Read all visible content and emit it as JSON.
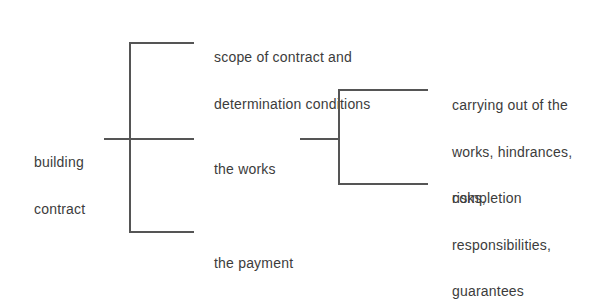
{
  "diagram": {
    "type": "tree",
    "line_color": "#555555",
    "text_color": "#3c3c3c",
    "root": {
      "label_lines": [
        "building",
        "contract"
      ]
    },
    "level1": [
      {
        "label_lines": [
          "scope of contract and",
          "determination conditions"
        ]
      },
      {
        "label_lines": [
          "the works"
        ]
      },
      {
        "label_lines": [
          "the payment"
        ]
      }
    ],
    "level2_of_the_works": [
      {
        "label_lines": [
          "carrying out of the",
          "works, hindrances,",
          "completion"
        ]
      },
      {
        "label_lines": [
          "risks,",
          "responsibilities,",
          "guarantees"
        ]
      }
    ]
  }
}
